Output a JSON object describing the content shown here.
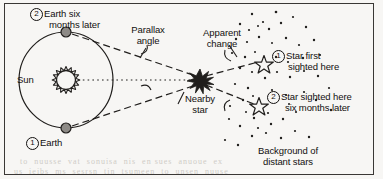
{
  "figure": {
    "background_color": "#f7f6f4",
    "ink_color": "#12100f",
    "frame": {
      "x": 4,
      "y": 3,
      "width": 370,
      "height": 172
    }
  },
  "labels": {
    "earth_six_months_later": {
      "marker": "2",
      "line1": "Earth six",
      "line2": "months later",
      "x": 30,
      "y": 6
    },
    "earth": {
      "marker": "1",
      "text": "Earth",
      "x": 26,
      "y": 139
    },
    "sun": {
      "text": "Sun",
      "x": 18,
      "y": 73
    },
    "parallax_angle": {
      "line1": "Parallax",
      "line2": "angle",
      "x": 124,
      "y": 27
    },
    "apparent_change": {
      "line1": "Apparent",
      "line2": "change",
      "x": 203,
      "y": 28
    },
    "nearby_star": {
      "line1": "Nearby",
      "line2": "star",
      "x": 176,
      "y": 94
    },
    "star_first_sighted": {
      "marker": "1",
      "line1": "Star first",
      "line2": "sighted here",
      "x": 277,
      "y": 52
    },
    "star_sighted_six_months_later": {
      "marker": "2",
      "line1": "Star sighted here",
      "line2": "six months later",
      "x": 277,
      "y": 93
    },
    "background_of_distant_stars": {
      "line1": "Background of",
      "line2": "distant stars",
      "x": 268,
      "y": 148
    }
  },
  "objects": {
    "orbit": {
      "cx": 66,
      "cy": 80,
      "rx": 47,
      "ry": 48
    },
    "sun_body": {
      "cx": 66,
      "cy": 80,
      "r": 10,
      "rays": 20
    },
    "earth_top": {
      "cx": 66,
      "cy": 32,
      "r": 5
    },
    "earth_bottom": {
      "cx": 66,
      "cy": 128,
      "r": 5
    },
    "nearby_star": {
      "cx": 200,
      "cy": 80,
      "r": 9
    },
    "star_one": {
      "cx": 264,
      "cy": 63,
      "r": 7
    },
    "star_two": {
      "cx": 259,
      "cy": 105,
      "r": 7
    }
  },
  "showthrough_text": {
    "row1": "to  nuusse  vat  sonuisa  nis  en sues  anuoue  ex",
    "row2": "us  ieibs  ms  sesrsn  tin  tsumeen  to  unsen  nuuse"
  }
}
